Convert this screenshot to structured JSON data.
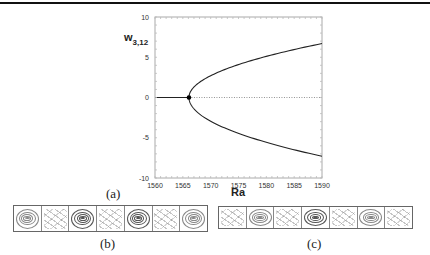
{
  "chart_data": {
    "type": "line",
    "title": "",
    "xlabel": "Ra",
    "ylabel": "w_{3,12}",
    "ylabel_main": "w",
    "ylabel_sub": "3,12",
    "xlim": [
      1560,
      1590
    ],
    "ylim": [
      -10,
      10
    ],
    "xticks": [
      1560,
      1565,
      1570,
      1575,
      1580,
      1585,
      1590
    ],
    "yticks": [
      -10,
      -5,
      0,
      5,
      10
    ],
    "grid": false,
    "legend": null,
    "bifurcation_point": {
      "x": 1566.1,
      "y": 0
    },
    "series": [
      {
        "name": "trivial branch (stable)",
        "style": "solid",
        "x": [
          1560,
          1566.1
        ],
        "y": [
          0,
          0
        ]
      },
      {
        "name": "trivial branch (unstable)",
        "style": "dotted",
        "x": [
          1566.1,
          1590
        ],
        "y": [
          0,
          0
        ]
      },
      {
        "name": "upper pitchfork branch",
        "style": "solid",
        "x": [
          1566.1,
          1567,
          1568,
          1570,
          1572,
          1575,
          1578,
          1581,
          1584,
          1587,
          1590
        ],
        "y": [
          0,
          1.3,
          1.9,
          2.7,
          3.3,
          4.1,
          4.7,
          5.3,
          5.8,
          6.3,
          6.7
        ]
      },
      {
        "name": "lower pitchfork branch",
        "style": "solid",
        "x": [
          1566.1,
          1567,
          1568,
          1570,
          1572,
          1575,
          1578,
          1581,
          1584,
          1587,
          1590
        ],
        "y": [
          0,
          -1.4,
          -2.0,
          -2.9,
          -3.6,
          -4.5,
          -5.2,
          -5.8,
          -6.4,
          -6.9,
          -7.3
        ]
      }
    ]
  },
  "captions": {
    "a": "(a)",
    "b": "(b)",
    "c": "(c)"
  },
  "panels": {
    "b": {
      "cells": [
        "roll-light",
        "disordered",
        "roll-dark",
        "disordered",
        "roll-dark",
        "disordered",
        "roll-light"
      ]
    },
    "c": {
      "cells": [
        "disordered",
        "roll-light",
        "disordered",
        "roll-dark",
        "disordered",
        "roll-light",
        "disordered"
      ]
    }
  }
}
